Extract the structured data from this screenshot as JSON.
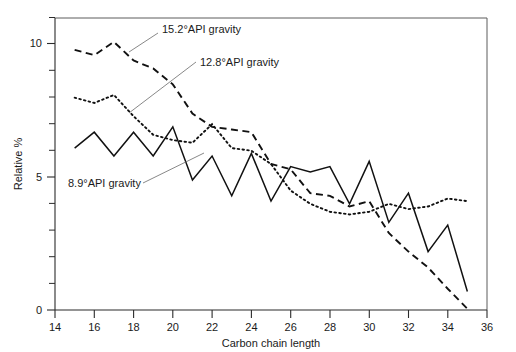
{
  "chart_data": {
    "type": "line",
    "title": "",
    "xlabel": "Carbon chain length",
    "ylabel": "Relative %",
    "xlim": [
      14,
      36
    ],
    "ylim": [
      0,
      11
    ],
    "xticks": [
      14,
      16,
      18,
      20,
      22,
      24,
      26,
      28,
      30,
      32,
      34,
      36
    ],
    "xticklabels": [
      "14",
      "16",
      "18",
      "20",
      "22",
      "24",
      "26",
      "28",
      "30",
      "32",
      "34",
      "36"
    ],
    "yticks": [
      0,
      5,
      10
    ],
    "yticklabels": [
      "0",
      "5",
      "10"
    ],
    "yminorticks": [
      1,
      2,
      3,
      4,
      6,
      7,
      8,
      9,
      11
    ],
    "grid": false,
    "legend_position": "inline-annotations",
    "x": [
      15,
      16,
      17,
      18,
      19,
      20,
      21,
      22,
      23,
      24,
      25,
      26,
      27,
      28,
      29,
      30,
      31,
      32,
      33,
      34,
      35
    ],
    "series": [
      {
        "name": "15.2°API gravity",
        "style": "dashed",
        "values": [
          9.8,
          9.6,
          10.1,
          9.4,
          9.1,
          8.5,
          7.4,
          6.9,
          6.8,
          6.7,
          5.5,
          5.3,
          4.4,
          4.3,
          3.9,
          4.1,
          2.9,
          2.2,
          1.6,
          0.8,
          0.05
        ]
      },
      {
        "name": "12.8°API gravity",
        "style": "dotted",
        "values": [
          8.0,
          7.8,
          8.1,
          7.3,
          6.6,
          6.4,
          6.3,
          7.0,
          6.1,
          6.0,
          5.5,
          4.5,
          4.0,
          3.7,
          3.6,
          3.7,
          4.0,
          3.8,
          3.9,
          4.2,
          4.1
        ]
      },
      {
        "name": "8.9°API gravity",
        "style": "solid",
        "values": [
          6.1,
          6.7,
          5.8,
          6.7,
          5.8,
          6.9,
          4.9,
          5.8,
          4.3,
          5.9,
          4.1,
          5.4,
          5.2,
          5.4,
          4.0,
          5.6,
          3.3,
          4.4,
          2.2,
          3.2,
          0.7
        ]
      }
    ],
    "annotations": [
      {
        "label": "15.2°API gravity",
        "target_x": 18.4,
        "target_y": 9.35
      },
      {
        "label": "12.8°API gravity",
        "target_x": 18.1,
        "target_y": 6.45
      },
      {
        "label": "8.9°API gravity",
        "target_x": 22.2,
        "target_y": 5.75
      }
    ]
  },
  "axes": {
    "xlabel": "Carbon chain length",
    "ylabel": "Relative %",
    "x_tick_labels": [
      "14",
      "16",
      "18",
      "20",
      "22",
      "24",
      "26",
      "28",
      "30",
      "32",
      "34",
      "36"
    ],
    "y_tick_labels": [
      "10",
      "5",
      "0"
    ]
  },
  "annotations": {
    "series_1": "15.2°API gravity",
    "series_2": "12.8°API gravity",
    "series_3": "8.9°API gravity"
  },
  "colors": {
    "line": "#111111",
    "axis": "#2b2b2b",
    "frame": "#5d5d5d",
    "background": "#ffffff",
    "leader": "#6a6a6a"
  }
}
